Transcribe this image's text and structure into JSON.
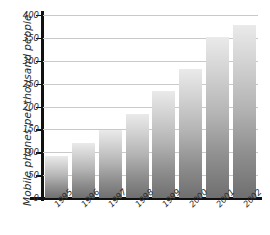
{
  "chart_data": {
    "type": "bar",
    "title": "",
    "xlabel": "",
    "ylabel": "Mobile phones per thousand people",
    "categories": [
      "1995",
      "1996",
      "1997",
      "1998",
      "1999",
      "2000",
      "2001",
      "2002"
    ],
    "values": [
      91,
      120,
      148,
      184,
      235,
      283,
      352,
      378
    ],
    "ylim": [
      0,
      400
    ],
    "ytick_labels": [
      "0",
      "50",
      "100",
      "150",
      "200",
      "250",
      "300",
      "350",
      "400"
    ],
    "ytick_values": [
      0,
      50,
      100,
      150,
      200,
      250,
      300,
      350,
      400
    ],
    "grid": true,
    "legend": "none",
    "series": [
      {
        "name": "Mobile phones per thousand people",
        "values": [
          91,
          120,
          148,
          184,
          235,
          283,
          352,
          378
        ]
      }
    ],
    "colors": {
      "bar_top": "#eaeaea",
      "bar_bottom": "#6f6f6f",
      "axis": "#111111",
      "gridline": "#c9c9c9",
      "text": "#2b2b2b",
      "background": "#ffffff"
    }
  }
}
